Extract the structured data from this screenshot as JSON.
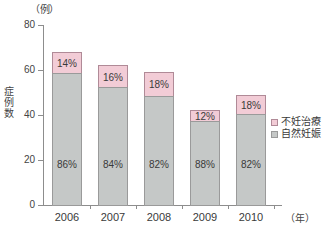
{
  "chart_data": {
    "type": "bar",
    "subtype": "stacked-percentage",
    "title": "",
    "xlabel": "（年）",
    "ylabel": "症例数",
    "y_unit_label": "（例）",
    "categories": [
      "2006",
      "2007",
      "2008",
      "2009",
      "2010"
    ],
    "ylim": [
      0,
      80
    ],
    "yticks": [
      0,
      20,
      40,
      60,
      80
    ],
    "ytick_labels": [
      "0",
      "20",
      "40",
      "60",
      "80"
    ],
    "grid": false,
    "legend_position": "right",
    "totals": [
      69,
      63,
      60,
      43,
      50
    ],
    "series": [
      {
        "name": "自然妊娠",
        "color": "#c5c8c7",
        "values": [
          59,
          53,
          49,
          38,
          41
        ],
        "percent_labels": [
          "86%",
          "84%",
          "82%",
          "88%",
          "82%"
        ]
      },
      {
        "name": "不妊治療",
        "color": "#f2ccd6",
        "values": [
          10,
          10,
          11,
          5,
          9
        ],
        "percent_labels": [
          "14%",
          "16%",
          "18%",
          "12%",
          "18%"
        ]
      }
    ]
  },
  "axis": {
    "y_unit": "（例）",
    "y_title_chars": [
      "症",
      "例",
      "数"
    ],
    "x_unit": "（年）",
    "ytick_labels": [
      "80",
      "60",
      "40",
      "20",
      "0"
    ]
  },
  "bars": [
    {
      "category": "2006",
      "total": 69,
      "pink_pct": "14%",
      "gray_pct": "86%"
    },
    {
      "category": "2007",
      "total": 63,
      "pink_pct": "16%",
      "gray_pct": "84%"
    },
    {
      "category": "2008",
      "total": 60,
      "pink_pct": "18%",
      "gray_pct": "82%"
    },
    {
      "category": "2009",
      "total": 43,
      "pink_pct": "12%",
      "gray_pct": "88%"
    },
    {
      "category": "2010",
      "total": 50,
      "pink_pct": "18%",
      "gray_pct": "82%"
    }
  ],
  "legend": {
    "items": [
      {
        "label": "不妊治療",
        "color": "#f2ccd6"
      },
      {
        "label": "自然妊娠",
        "color": "#c5c8c7"
      }
    ]
  },
  "colors": {
    "pink": "#f2ccd6",
    "pink_border": "#b08a97",
    "gray": "#c5c8c7",
    "gray_border": "#9a9a9a",
    "axis": "#8d8d8d",
    "text": "#3a3a3a",
    "background": "#ffffff"
  }
}
